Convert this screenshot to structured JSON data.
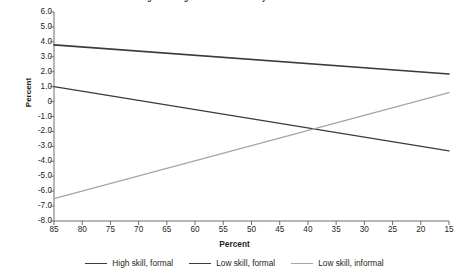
{
  "chart_data": {
    "type": "line",
    "title": "Figure 3. Degree of Substitutability between Sectors",
    "xlabel": "Percent",
    "ylabel": "Percent",
    "xlim": [
      85,
      15
    ],
    "ylim": [
      -8.0,
      6.0
    ],
    "x_reversed": true,
    "grid": false,
    "legend_position": "bottom",
    "x": [
      85,
      15
    ],
    "xticks": [
      85,
      80,
      75,
      70,
      65,
      60,
      55,
      50,
      45,
      40,
      35,
      30,
      25,
      20,
      15
    ],
    "yticks": [
      "6.0",
      "5.0",
      "4.0",
      "3.0",
      "2.0",
      "1.0",
      "0",
      "-1.0",
      "-2.0",
      "-3.0",
      "-4.0",
      "-5.0",
      "-6.0",
      "-7.0",
      "-8.0"
    ],
    "ytick_values": [
      6.0,
      5.0,
      4.0,
      3.0,
      2.0,
      1.0,
      0,
      -1.0,
      -2.0,
      -3.0,
      -4.0,
      -5.0,
      -6.0,
      -7.0,
      -8.0
    ],
    "series": [
      {
        "name": "High skill, formal",
        "color": "#3b3b3b",
        "width": 1.6,
        "values": [
          3.8,
          1.85
        ]
      },
      {
        "name": "Low skill, formal",
        "color": "#3b3b3b",
        "width": 1.4,
        "values": [
          1.0,
          -3.3
        ]
      },
      {
        "name": "Low skill, informal",
        "color": "#a6a6a6",
        "width": 1.4,
        "values": [
          -6.5,
          0.6
        ]
      }
    ]
  },
  "axis": {
    "line_color": "#6d6e71"
  }
}
